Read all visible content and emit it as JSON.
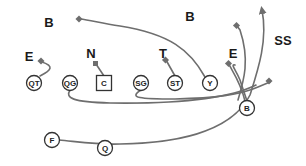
{
  "diagram": {
    "type": "football-play",
    "colors": {
      "route": "#6e6e6e",
      "player_stroke": "#333333",
      "label": "#1a1a1a"
    },
    "defense": [
      {
        "id": "def-b-left",
        "label": "B",
        "x": 49,
        "y": 22
      },
      {
        "id": "def-b-right",
        "label": "B",
        "x": 190,
        "y": 16
      },
      {
        "id": "def-e-left",
        "label": "E",
        "x": 29,
        "y": 56
      },
      {
        "id": "def-n",
        "label": "N",
        "x": 91,
        "y": 53
      },
      {
        "id": "def-t",
        "label": "T",
        "x": 163,
        "y": 53
      },
      {
        "id": "def-e-right",
        "label": "E",
        "x": 233,
        "y": 53
      },
      {
        "id": "def-ss",
        "label": "SS",
        "x": 283,
        "y": 40
      }
    ],
    "offense": [
      {
        "id": "qt",
        "label": "QT",
        "shape": "circle",
        "x": 34,
        "y": 83
      },
      {
        "id": "qg",
        "label": "QG",
        "shape": "circle",
        "x": 70,
        "y": 83
      },
      {
        "id": "c",
        "label": "C",
        "shape": "square",
        "x": 104,
        "y": 83
      },
      {
        "id": "sg",
        "label": "SG",
        "shape": "circle",
        "x": 141,
        "y": 83
      },
      {
        "id": "st",
        "label": "ST",
        "shape": "circle",
        "x": 175,
        "y": 83
      },
      {
        "id": "y",
        "label": "Y",
        "shape": "circle",
        "x": 210,
        "y": 83
      },
      {
        "id": "b",
        "label": "B",
        "shape": "circle",
        "x": 247,
        "y": 108
      },
      {
        "id": "f",
        "label": "F",
        "shape": "circle",
        "x": 52,
        "y": 140
      },
      {
        "id": "q",
        "label": "Q",
        "shape": "circle",
        "x": 105,
        "y": 148
      }
    ]
  }
}
